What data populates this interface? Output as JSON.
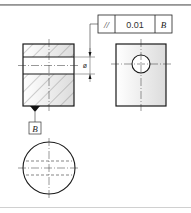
{
  "drawing": {
    "title": "Parallelism tolerance of hole axis relative to datum",
    "feature_control_frame": {
      "symbol": "//",
      "symbol_name": "parallelism",
      "tolerance": "0.01",
      "datum": "B"
    },
    "datum_label": "B",
    "diameter_symbol": "ø",
    "views": [
      "front-section-view",
      "side-view",
      "top-view"
    ],
    "colors": {
      "line": "#1a1a1a",
      "hatch": "#555555",
      "fill_gradient_start": "#ffffff",
      "fill_gradient_end": "#dcdcdc"
    }
  }
}
